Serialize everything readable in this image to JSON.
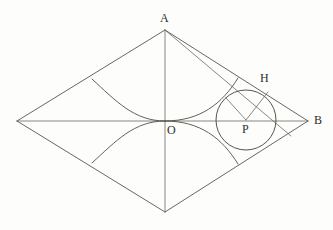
{
  "figure": {
    "canvas": {
      "width": 333,
      "height": 230,
      "background": "#fdfdfb"
    },
    "stroke_color": "#57564f",
    "label_color": "#2e2e2b",
    "points": [
      {
        "id": "A",
        "name": "apex-vertex",
        "label": "A",
        "x": 165,
        "y": 30,
        "label_x": 160,
        "label_y": 12
      },
      {
        "id": "B",
        "name": "right-vertex",
        "label": "B",
        "x": 308,
        "y": 121,
        "label_x": 314,
        "label_y": 114
      },
      {
        "id": "L",
        "name": "left-vertex",
        "label": "",
        "x": 17,
        "y": 121,
        "label_x": 0,
        "label_y": 0
      },
      {
        "id": "D",
        "name": "bottom-vertex",
        "label": "",
        "x": 165,
        "y": 212,
        "label_x": 0,
        "label_y": 0
      },
      {
        "id": "O",
        "name": "center-point",
        "label": "O",
        "x": 165,
        "y": 121,
        "label_x": 167,
        "label_y": 124
      },
      {
        "id": "P",
        "name": "circle-center-point",
        "label": "P",
        "x": 246,
        "y": 120,
        "label_x": 242,
        "label_y": 123
      },
      {
        "id": "H",
        "name": "tangent-point-h",
        "label": "H",
        "x": 268,
        "y": 92,
        "label_x": 260,
        "label_y": 72
      }
    ],
    "circle": {
      "name": "inscribed-circle",
      "cx": 246,
      "cy": 120,
      "r": 30
    },
    "segments": [
      {
        "name": "edge-a-left",
        "x1": 165,
        "y1": 30,
        "x2": 17,
        "y2": 121
      },
      {
        "name": "edge-a-right",
        "x1": 165,
        "y1": 30,
        "x2": 308,
        "y2": 121
      },
      {
        "name": "edge-left-bottom",
        "x1": 17,
        "y1": 121,
        "x2": 165,
        "y2": 212
      },
      {
        "name": "edge-bottom-right",
        "x1": 165,
        "y1": 212,
        "x2": 308,
        "y2": 121
      },
      {
        "name": "diagonal-vertical",
        "x1": 165,
        "y1": 30,
        "x2": 165,
        "y2": 212
      },
      {
        "name": "diagonal-horizontal",
        "x1": 17,
        "y1": 121,
        "x2": 308,
        "y2": 121
      },
      {
        "name": "segment-a-to-h",
        "x1": 165,
        "y1": 30,
        "x2": 290,
        "y2": 135
      },
      {
        "name": "radius-p-to-h",
        "x1": 246,
        "y1": 120,
        "x2": 268,
        "y2": 92
      },
      {
        "name": "radius-p-to-tangent",
        "x1": 246,
        "y1": 120,
        "x2": 226,
        "y2": 98
      }
    ],
    "arcs": [
      {
        "name": "arc-upper-left",
        "d": "M 92 79 Q 120 121 165 121"
      },
      {
        "name": "arc-lower-left",
        "d": "M 92 163 Q 120 121 165 121"
      },
      {
        "name": "arc-upper-right",
        "d": "M 165 121 Q 212 121 238 78"
      },
      {
        "name": "arc-lower-right",
        "d": "M 165 121 Q 212 121 238 164"
      }
    ]
  }
}
